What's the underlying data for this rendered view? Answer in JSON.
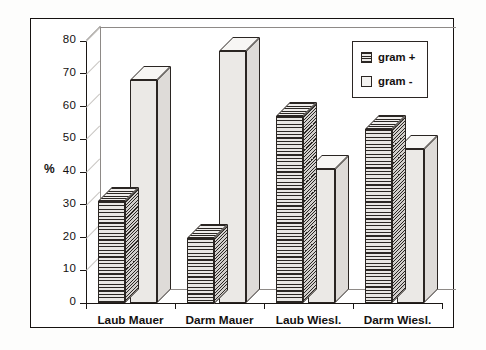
{
  "chart_data": {
    "type": "bar",
    "title": "",
    "subtitle": "",
    "xlabel": "",
    "ylabel": "%",
    "ylim": [
      0,
      80
    ],
    "yticks": [
      0,
      10,
      20,
      30,
      40,
      50,
      60,
      70,
      80
    ],
    "grid": false,
    "style": "3d-grouped-bar",
    "legend_position": "top-right",
    "categories": [
      "Laub Mauer",
      "Darm Mauer",
      "Laub Wiesl.",
      "Darm Wiesl."
    ],
    "series": [
      {
        "name": "gram +",
        "fill": "horizontal-hatch",
        "values": [
          31,
          20,
          57,
          53
        ]
      },
      {
        "name": "gram -",
        "fill": "solid-light",
        "values": [
          68,
          77,
          41,
          47
        ]
      }
    ]
  },
  "axes": {
    "y_label": "%",
    "y_tick_labels": [
      "0",
      "10",
      "20",
      "30",
      "40",
      "50",
      "60",
      "70",
      "80"
    ],
    "x_tick_labels": [
      "Laub Mauer",
      "Darm Mauer",
      "Laub Wiesl.",
      "Darm Wiesl."
    ]
  },
  "legend": {
    "entries": [
      {
        "label": "gram +",
        "swatch": "hatched-square-icon"
      },
      {
        "label": "gram -",
        "swatch": "empty-square-icon"
      }
    ]
  },
  "colors": {
    "ink": "#161210",
    "bar_gram_plus_fill": "#cfcdca",
    "bar_gram_minus_fill": "#ebe9e6",
    "frame": "#161210",
    "background": "#ffffff",
    "grid_faint": "#8e8a87"
  }
}
